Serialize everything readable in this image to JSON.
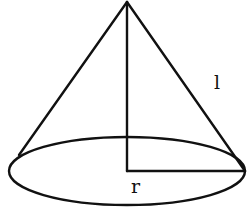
{
  "diagram": {
    "labels": {
      "slant_height": "l",
      "radius": "r"
    },
    "colors": {
      "stroke": "#111111",
      "background": "#ffffff"
    },
    "geometry": {
      "apex": [
        127,
        2
      ],
      "base_center": [
        127,
        171
      ],
      "base_rx": 118,
      "base_ry": 34,
      "left_tangent": [
        20,
        153
      ],
      "right_point": [
        245,
        171
      ]
    }
  }
}
